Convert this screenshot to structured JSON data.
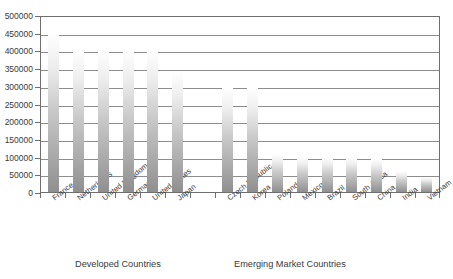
{
  "chart_data": {
    "type": "bar",
    "title": "",
    "subtitle": "",
    "xlabel": "",
    "ylabel": "",
    "ylim": [
      0,
      500000
    ],
    "ytick_step": 50000,
    "grid": true,
    "legend": null,
    "orientation": "vertical",
    "bar_color": "#a0a0a0",
    "bar_gradient_top": "#ffffff",
    "bar_gradient_bottom": "#8f8f8f",
    "axis_color": "#6f6f6f",
    "gridline_color": "#8d8d8d",
    "text_color": "#3a3a3a",
    "ytick_labels": [
      "500000",
      "450000",
      "400000",
      "350000",
      "300000",
      "250000",
      "200000",
      "150000",
      "100000",
      "50000",
      "0"
    ],
    "ytick_values": [
      500000,
      450000,
      400000,
      350000,
      300000,
      250000,
      200000,
      150000,
      100000,
      50000,
      0
    ],
    "categories": [
      "France",
      "Netherlands",
      "United Kingdom",
      "Germany",
      "United States",
      "Japan",
      "Czech Republic",
      "Korea",
      "Poland",
      "Mexico",
      "Brazil",
      "South Africa",
      "China",
      "India",
      "Vietnam"
    ],
    "values": [
      445000,
      400000,
      400000,
      400000,
      400000,
      340000,
      295000,
      295000,
      107000,
      100000,
      100000,
      100000,
      93000,
      60000,
      42000
    ],
    "groups": [
      {
        "label": "Developed Countries",
        "categories": [
          "France",
          "Netherlands",
          "United Kingdom",
          "Germany",
          "United States",
          "Japan"
        ]
      },
      {
        "label": "Emerging Market Countries",
        "categories": [
          "Czech Republic",
          "Korea",
          "Poland",
          "Mexico",
          "Brazil",
          "South Africa",
          "China",
          "India",
          "Vietnam"
        ]
      }
    ],
    "group_gap_after_index": 5
  }
}
